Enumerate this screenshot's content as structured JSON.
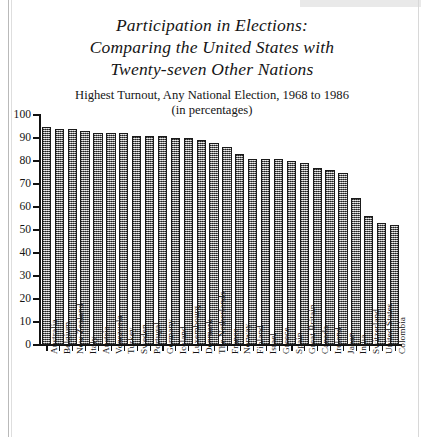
{
  "figure": {
    "title_lines": [
      "Participation in Elections:",
      "Comparing the United States with",
      "Twenty-seven Other Nations"
    ],
    "subtitle_lines": [
      "Highest Turnout, Any National Election, 1968 to 1986",
      "(in percentages)"
    ],
    "bottom_caption": "",
    "colors": {
      "ink": "#151515",
      "axis": "#111111",
      "bar_fill": "#8a8a8a",
      "bar_edge": "#1a1a1a",
      "page": "#ffffff"
    }
  },
  "chart_data": {
    "type": "bar",
    "title": "Participation in Elections: Comparing the United States with Twenty-seven Other Nations",
    "subtitle": "Highest Turnout, Any National Election, 1968 to 1986 (in percentages)",
    "xlabel": "",
    "ylabel": "",
    "ylim": [
      0,
      100
    ],
    "yticks": [
      0,
      10,
      20,
      30,
      40,
      50,
      60,
      70,
      80,
      90,
      100
    ],
    "ytick_labels": [
      "0",
      "10",
      "20",
      "30",
      "40",
      "50",
      "60",
      "70",
      "80",
      "90",
      "100"
    ],
    "grid": false,
    "legend": "none",
    "orientation": "vertical",
    "categories": [
      "Australia",
      "Belgium",
      "New Zealand",
      "Italy",
      "Austria",
      "Venezuela",
      "Turkey",
      "Sweden",
      "Portugal",
      "Germany",
      "Iceland",
      "Luxembourg",
      "Denmark",
      "The Netherlands",
      "France",
      "Norway",
      "Finland",
      "Israel",
      "Greece",
      "Spain",
      "Great Britain",
      "Canada",
      "Ireland",
      "Japan",
      "India",
      "Switzerland",
      "United States",
      "Colombia"
    ],
    "values": [
      95,
      94,
      94,
      93,
      92,
      92,
      92,
      91,
      91,
      91,
      90,
      90,
      89,
      88,
      86,
      83,
      81,
      81,
      81,
      80,
      79,
      77,
      76,
      75,
      64,
      56,
      53,
      52
    ]
  }
}
